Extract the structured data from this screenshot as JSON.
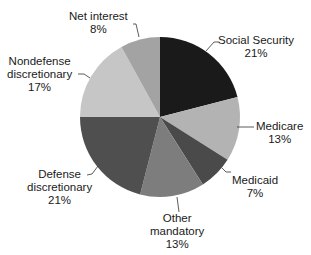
{
  "chart_data": {
    "type": "pie",
    "title": "",
    "start_angle_deg": 0,
    "direction": "clockwise",
    "center": [
      160,
      117
    ],
    "radius": 80,
    "slices": [
      {
        "label": "Social Security",
        "value": 21,
        "display": "21%",
        "color": "#1a1a1a"
      },
      {
        "label": "Medicare",
        "value": 13,
        "display": "13%",
        "color": "#b3b3b3"
      },
      {
        "label": "Medicaid",
        "value": 7,
        "display": "7%",
        "color": "#4a4a4a"
      },
      {
        "label": "Other mandatory",
        "value": 13,
        "display": "13%",
        "color": "#7d7d7d"
      },
      {
        "label": "Defense discretionary",
        "value": 21,
        "display": "21%",
        "color": "#4f4f4f"
      },
      {
        "label": "Nondefense discretionary",
        "value": 17,
        "display": "17%",
        "color": "#c6c6c6"
      },
      {
        "label": "Net interest",
        "value": 8,
        "display": "8%",
        "color": "#a3a3a3"
      }
    ],
    "legend": "none (direct labels with leader lines)"
  },
  "labels": {
    "social_security": {
      "line1": "Social Security",
      "pct": "21%"
    },
    "medicare": {
      "line1": "Medicare",
      "pct": "13%"
    },
    "medicaid": {
      "line1": "Medicaid",
      "pct": "7%"
    },
    "other_mandatory": {
      "line1": "Other",
      "line2": "mandatory",
      "pct": "13%"
    },
    "defense": {
      "line1": "Defense",
      "line2": "discretionary",
      "pct": "21%"
    },
    "nondefense": {
      "line1": "Nondefense",
      "line2": "discretionary",
      "pct": "17%"
    },
    "net_interest": {
      "line1": "Net interest",
      "pct": "8%"
    }
  }
}
